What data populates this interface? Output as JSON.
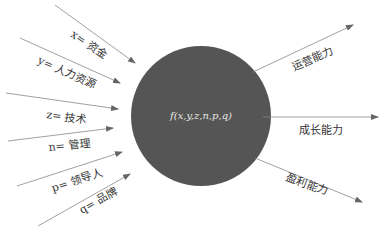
{
  "center": {
    "label": "f(x,y,z,n,p,q)",
    "fill": "#555555"
  },
  "inputs": [
    {
      "var": "x",
      "label": "x= 资金"
    },
    {
      "var": "y",
      "label": "y= 人力资源"
    },
    {
      "var": "z",
      "label": "z= 技术"
    },
    {
      "var": "n",
      "label": "n= 管理"
    },
    {
      "var": "p",
      "label": "p= 领导人"
    },
    {
      "var": "q",
      "label": "q= 品牌"
    }
  ],
  "outputs": [
    {
      "label": "运营能力"
    },
    {
      "label": "成长能力"
    },
    {
      "label": "盈利能力"
    }
  ],
  "colors": {
    "arrow": "#777777",
    "text": "#333333",
    "circle": "#555555"
  }
}
